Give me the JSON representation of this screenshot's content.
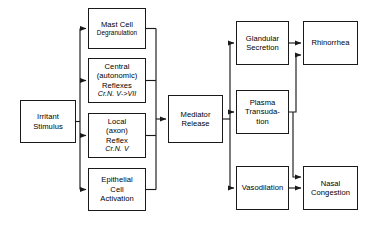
{
  "diagram": {
    "type": "flowchart",
    "colors": {
      "stroke": "#1a1a1a",
      "fill": "#ffffff",
      "text": "#000000"
    },
    "nodes": [
      {
        "id": "irritant-stimulus",
        "lines": [
          "Irritant",
          "Stimulus"
        ],
        "x": 20,
        "y": 100,
        "w": 56,
        "h": 43
      },
      {
        "id": "mast-cell-degranulation",
        "lines": [
          "Mast Cell",
          "Degranulation"
        ],
        "x": 88,
        "y": 8,
        "w": 58,
        "h": 41
      },
      {
        "id": "central-autonomic-reflexes",
        "lines": [
          "Central",
          "(autonomic)",
          "Reflexes",
          "Cr.N.  V->VII"
        ],
        "x": 88,
        "y": 58,
        "w": 58,
        "h": 45
      },
      {
        "id": "local-axon-reflex",
        "lines": [
          "Local",
          "(axon)",
          "Reflex",
          "Cr.N. V"
        ],
        "x": 88,
        "y": 113,
        "w": 58,
        "h": 45
      },
      {
        "id": "epithelial-cell-activation",
        "lines": [
          "Epithelial",
          "Cell",
          "Activation"
        ],
        "x": 88,
        "y": 168,
        "w": 58,
        "h": 43
      },
      {
        "id": "mediator-release",
        "lines": [
          "Mediator",
          "Release"
        ],
        "x": 168,
        "y": 95,
        "w": 55,
        "h": 48
      },
      {
        "id": "glandular-secretion",
        "lines": [
          "Glandular",
          "Secretion"
        ],
        "x": 236,
        "y": 21,
        "w": 53,
        "h": 44
      },
      {
        "id": "plasma-transudation",
        "lines": [
          "Plasma",
          "Transuda-",
          "tion"
        ],
        "x": 236,
        "y": 90,
        "w": 53,
        "h": 44
      },
      {
        "id": "vasodilation",
        "lines": [
          "Vasodilation"
        ],
        "x": 236,
        "y": 166,
        "w": 53,
        "h": 44
      },
      {
        "id": "rhinorrhea",
        "lines": [
          "Rhinorrhea"
        ],
        "x": 303,
        "y": 21,
        "w": 55,
        "h": 44
      },
      {
        "id": "nasal-congestion",
        "lines": [
          "Nasal",
          "Congestion"
        ],
        "x": 303,
        "y": 166,
        "w": 55,
        "h": 44
      }
    ],
    "edges": [
      {
        "from": "irritant-stimulus",
        "to": "mast-cell-degranulation"
      },
      {
        "from": "irritant-stimulus",
        "to": "central-autonomic-reflexes"
      },
      {
        "from": "irritant-stimulus",
        "to": "local-axon-reflex"
      },
      {
        "from": "irritant-stimulus",
        "to": "epithelial-cell-activation"
      },
      {
        "from": "mast-cell-degranulation",
        "to": "mediator-release"
      },
      {
        "from": "central-autonomic-reflexes",
        "to": "mediator-release"
      },
      {
        "from": "local-axon-reflex",
        "to": "mediator-release"
      },
      {
        "from": "epithelial-cell-activation",
        "to": "mediator-release"
      },
      {
        "from": "mediator-release",
        "to": "glandular-secretion"
      },
      {
        "from": "mediator-release",
        "to": "plasma-transudation"
      },
      {
        "from": "mediator-release",
        "to": "vasodilation"
      },
      {
        "from": "glandular-secretion",
        "to": "rhinorrhea"
      },
      {
        "from": "plasma-transudation",
        "to": "rhinorrhea"
      },
      {
        "from": "plasma-transudation",
        "to": "nasal-congestion"
      },
      {
        "from": "vasodilation",
        "to": "nasal-congestion"
      }
    ]
  }
}
